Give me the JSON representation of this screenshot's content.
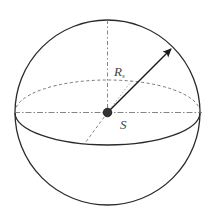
{
  "diagram": {
    "type": "sphere",
    "labels": {
      "radius_main": "R",
      "radius_sub": "s",
      "center": "S"
    },
    "colors": {
      "outline": "#2a2a2a",
      "dashed": "#666666",
      "center_dot": "#333333",
      "arrow": "#1a1a1a",
      "background": "#ffffff"
    }
  }
}
